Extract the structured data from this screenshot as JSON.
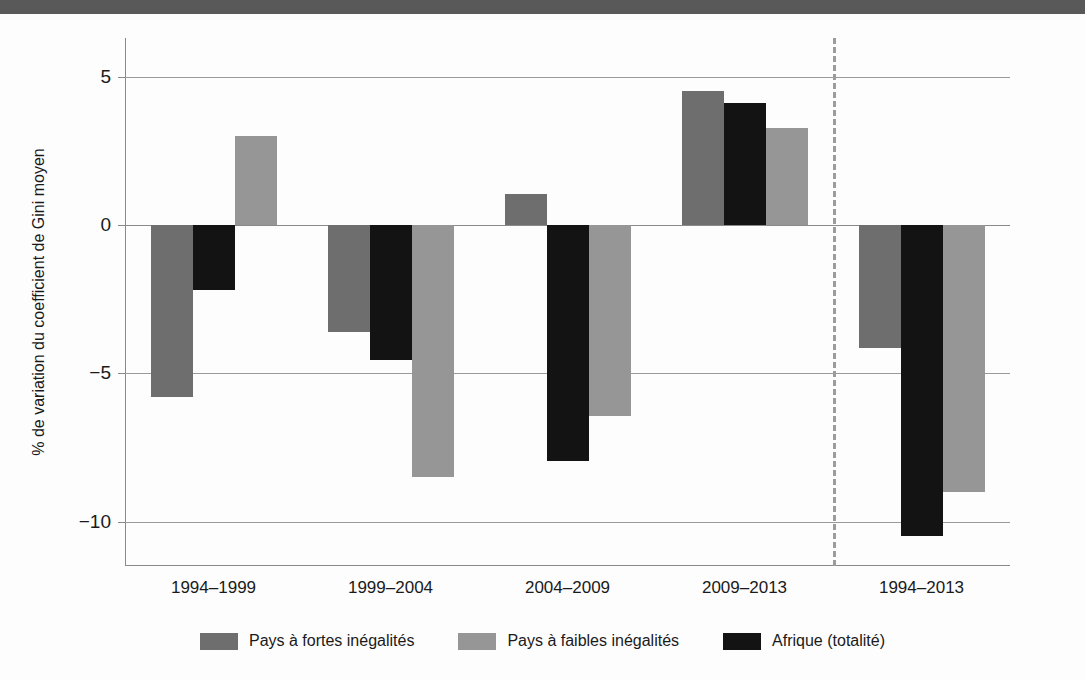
{
  "banner": {
    "text": ""
  },
  "chart_data": {
    "type": "bar",
    "title": "",
    "xlabel": "",
    "ylabel": "% de variation du coefficient de Gini moyen",
    "ylim": [
      -11.5,
      6.3
    ],
    "yticks": [
      5,
      0,
      -5,
      -10
    ],
    "ytick_labels": [
      "5",
      "0",
      "−5",
      "−10"
    ],
    "grid": true,
    "legend_position": "bottom",
    "categories": [
      "1994–1999",
      "1999–2004",
      "2004–2009",
      "2009–2013",
      "1994–2013"
    ],
    "series": [
      {
        "name": "Pays à fortes inégalités",
        "color": "#6e6e6e",
        "values": [
          -5.8,
          -3.6,
          1.05,
          4.5,
          -4.15
        ]
      },
      {
        "name": "Afrique (totalité)",
        "color": "#131313",
        "values": [
          -2.2,
          -4.55,
          -7.95,
          4.1,
          -10.5
        ]
      },
      {
        "name": "Pays à faibles inégalités",
        "color": "#969696",
        "values": [
          3.0,
          -8.5,
          -6.45,
          3.25,
          -9.0
        ]
      }
    ],
    "series_order_in_group": [
      "Pays à fortes inégalités",
      "Afrique (totalité)",
      "Pays à faibles inégalités"
    ],
    "annotations": [
      {
        "type": "vertical-dashed-separator",
        "after_category": "2009–2013",
        "color": "#9c9c9c"
      }
    ]
  },
  "legend": {
    "items": [
      {
        "label": "Pays à fortes inégalités",
        "swatch": "high"
      },
      {
        "label": "Pays à faibles inégalités",
        "swatch": "low"
      },
      {
        "label": "Afrique (totalité)",
        "swatch": "africa"
      }
    ]
  },
  "colors": {
    "high_inequality": "#6e6e6e",
    "low_inequality": "#969696",
    "africa_total": "#131313",
    "gridline": "#9a9a9a",
    "axis": "#8a8a8a",
    "separator": "#9c9c9c",
    "banner": "#595959",
    "background": "#fdfdfd"
  }
}
